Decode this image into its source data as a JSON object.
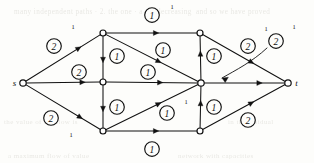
{
  "figure": {
    "type": "flow-network-diagram",
    "caption": "",
    "ink_color": "#111111",
    "paper_color": "#fdfdfb",
    "ghost_text_color": "#b9b7ad",
    "width": 314,
    "height": 163
  },
  "nodes": [
    {
      "id": "s",
      "label": "s",
      "label_side": "left",
      "x": 23,
      "y": 83,
      "r": 3.2
    },
    {
      "id": "a",
      "label": "",
      "label_side": "none",
      "x": 103,
      "y": 33,
      "r": 3.0
    },
    {
      "id": "b",
      "label": "",
      "label_side": "none",
      "x": 103,
      "y": 82,
      "r": 3.0
    },
    {
      "id": "c",
      "label": "",
      "label_side": "none",
      "x": 103,
      "y": 131,
      "r": 3.0
    },
    {
      "id": "d",
      "label": "",
      "label_side": "none",
      "x": 200,
      "y": 33,
      "r": 3.0
    },
    {
      "id": "e",
      "label": "",
      "label_side": "none",
      "x": 201,
      "y": 83,
      "r": 3.2
    },
    {
      "id": "f",
      "label": "",
      "label_side": "none",
      "x": 200,
      "y": 131,
      "r": 3.0
    },
    {
      "id": "t",
      "label": "t",
      "label_side": "right",
      "x": 288,
      "y": 83,
      "r": 3.2
    }
  ],
  "edges": [
    {
      "id": "s-a",
      "from": "s",
      "to": "a",
      "capacity": "2",
      "badge_x": 54,
      "badge_y": 46,
      "tick": "1",
      "tick_x": 73,
      "tick_y": 29,
      "arrow_t": 0.74
    },
    {
      "id": "s-b",
      "from": "s",
      "to": "b",
      "capacity": "2",
      "badge_x": 79,
      "badge_y": 72,
      "tick": "",
      "tick_x": 0,
      "tick_y": 0,
      "arrow_t": 0.8
    },
    {
      "id": "s-c",
      "from": "s",
      "to": "c",
      "capacity": "2",
      "badge_x": 51,
      "badge_y": 118,
      "tick": "1",
      "tick_x": 71,
      "tick_y": 137,
      "arrow_t": 0.76
    },
    {
      "id": "a-d",
      "from": "a",
      "to": "d",
      "capacity": "1",
      "badge_x": 152,
      "badge_y": 15,
      "tick": "1",
      "tick_x": 172,
      "tick_y": 9,
      "arrow_t": 0.58
    },
    {
      "id": "a-b",
      "from": "a",
      "to": "b",
      "capacity": "1",
      "badge_x": 117,
      "badge_y": 56,
      "tick": "",
      "tick_x": 0,
      "tick_y": 0,
      "arrow_t": 0.62
    },
    {
      "id": "a-e",
      "from": "a",
      "to": "e",
      "capacity": "1",
      "badge_x": 163,
      "badge_y": 50,
      "tick": "",
      "tick_x": 0,
      "tick_y": 0,
      "arrow_t": 0.6
    },
    {
      "id": "b-c",
      "from": "b",
      "to": "c",
      "capacity": "1",
      "badge_x": 117,
      "badge_y": 107,
      "tick": "",
      "tick_x": 0,
      "tick_y": 0,
      "arrow_t": 0.62
    },
    {
      "id": "b-e",
      "from": "b",
      "to": "e",
      "capacity": "1",
      "badge_x": 148,
      "badge_y": 72,
      "tick": "",
      "tick_x": 0,
      "tick_y": 0,
      "arrow_t": 0.62
    },
    {
      "id": "c-e",
      "from": "c",
      "to": "e",
      "capacity": "1",
      "badge_x": 167,
      "badge_y": 113,
      "tick": "1",
      "tick_x": 186,
      "tick_y": 104,
      "arrow_t": 0.6
    },
    {
      "id": "c-f",
      "from": "c",
      "to": "f",
      "capacity": "1",
      "badge_x": 152,
      "badge_y": 149,
      "tick": "",
      "tick_x": 0,
      "tick_y": 0,
      "arrow_t": 0.58
    },
    {
      "id": "f-e",
      "from": "f",
      "to": "e",
      "capacity": "1",
      "badge_x": 214,
      "badge_y": 107,
      "tick": "",
      "tick_x": 0,
      "tick_y": 0,
      "arrow_t": 0.66
    },
    {
      "id": "e-d",
      "from": "e",
      "to": "d",
      "capacity": "1",
      "badge_x": 214,
      "badge_y": 56,
      "tick": "",
      "tick_x": 0,
      "tick_y": 0,
      "arrow_t": 0.66
    },
    {
      "id": "d-t",
      "from": "d",
      "to": "t",
      "capacity": "2",
      "badge_x": 248,
      "badge_y": 46,
      "tick": "1",
      "tick_x": 266,
      "tick_y": 31,
      "arrow_t": 0.62
    },
    {
      "id": "e-t",
      "from": "e",
      "to": "t",
      "capacity": "2",
      "badge_x": 276,
      "badge_y": 41,
      "tick": "1",
      "tick_x": 294,
      "tick_y": 29,
      "arrow_t": 0.72,
      "leader": true
    },
    {
      "id": "f-t",
      "from": "f",
      "to": "t",
      "capacity": "2",
      "badge_x": 248,
      "badge_y": 120,
      "tick": "",
      "tick_x": 0,
      "tick_y": 0,
      "arrow_t": 0.62
    }
  ],
  "leader": {
    "description": "curved pointer from outer capacity badge to the edge entering t",
    "path": "M 267 48 C 252 62, 236 70, 222 78"
  },
  "ghost_text": {
    "description": "faint show-through text from reverse of page",
    "lines": [
      {
        "text": "many independent paths  ·  2.  the  one  ·  a  nondecreasing",
        "x": 14,
        "y": 8,
        "size": 7.2
      },
      {
        "text": "and  so  we  have  proved",
        "x": 196,
        "y": 8,
        "size": 7.2
      },
      {
        "text": "the  value  of  the  flow  is",
        "x": 4,
        "y": 118,
        "size": 7.0
      },
      {
        "text": "a  maximum  flow  of  value",
        "x": 8,
        "y": 152,
        "size": 7.0
      },
      {
        "text": "network  with  capacities",
        "x": 178,
        "y": 152,
        "size": 7.0
      },
      {
        "text": "in  the  residual",
        "x": 228,
        "y": 118,
        "size": 7.0
      }
    ]
  },
  "legend": {
    "capacity_note": "circled numbers are edge capacities",
    "superscript_note": "small superscript 1 marks flow on selected edges"
  }
}
